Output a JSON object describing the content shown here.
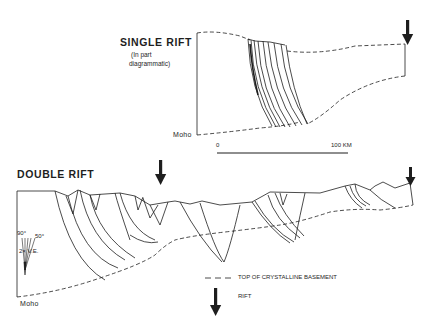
{
  "figure": {
    "single_rift": {
      "title": "SINGLE RIFT",
      "note_line1": "(In part",
      "note_line2": "diagrammatic)",
      "moho_label": "Moho"
    },
    "scale_bar": {
      "start_label": "0",
      "end_label": "100 KM"
    },
    "double_rift": {
      "title": "DOUBLE RIFT",
      "moho_label": "Moho",
      "angle_90": "90°",
      "angle_50": "50°",
      "exaggeration": "2× V.E."
    },
    "legend": {
      "items": [
        {
          "symbol": "dashed-line",
          "label": "TOP OF CRYSTALLINE BASEMENT"
        },
        {
          "symbol": "down-arrow",
          "label": "RIFT"
        }
      ]
    },
    "colors": {
      "ink": "#1e1e1e",
      "background": "#ffffff"
    }
  }
}
